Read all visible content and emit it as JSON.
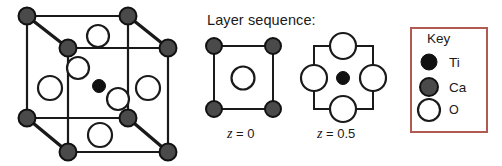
{
  "figure": {
    "title": "",
    "background": "#ffffff",
    "width": 502,
    "height": 166
  },
  "colors": {
    "ti": "#111111",
    "ca": "#4a4a4a",
    "oxygen_fill": "#ffffff",
    "outline": "#1a1a1a",
    "key_border": "#b05a52",
    "text": "#1a1a1a"
  },
  "unit_cell": {
    "name": "perovskite-unit-cell",
    "edges_stroke": "#1a1a1a",
    "vertices": [
      {
        "name": "back-top-left",
        "x": 27,
        "y": 16,
        "species": "Ca"
      },
      {
        "name": "back-top-right",
        "x": 128,
        "y": 16,
        "species": "Ca"
      },
      {
        "name": "front-top-left",
        "x": 68,
        "y": 48,
        "species": "Ca"
      },
      {
        "name": "front-top-right",
        "x": 168,
        "y": 48,
        "species": "Ca"
      },
      {
        "name": "back-bottom-left",
        "x": 27,
        "y": 118,
        "species": "Ca"
      },
      {
        "name": "back-bottom-right",
        "x": 128,
        "y": 118,
        "species": "Ca"
      },
      {
        "name": "front-bottom-left",
        "x": 68,
        "y": 152,
        "species": "Ca"
      },
      {
        "name": "front-bottom-right",
        "x": 168,
        "y": 152,
        "species": "Ca"
      }
    ],
    "oxygen_atoms": [
      {
        "name": "o-top-face",
        "x": 98,
        "y": 36,
        "r": 11
      },
      {
        "name": "o-left-face",
        "x": 50,
        "y": 88,
        "r": 12
      },
      {
        "name": "o-back-face",
        "x": 78,
        "y": 68,
        "r": 11
      },
      {
        "name": "o-front-face",
        "x": 118,
        "y": 99,
        "r": 11
      },
      {
        "name": "o-right-face",
        "x": 148,
        "y": 88,
        "r": 12
      },
      {
        "name": "o-bottom-face",
        "x": 100,
        "y": 135,
        "r": 12
      }
    ],
    "titanium_atoms": [
      {
        "name": "ti-body-center",
        "x": 99,
        "y": 86,
        "r": 6.5
      }
    ]
  },
  "layer_sequence": {
    "title": "Layer sequence:",
    "layers": [
      {
        "name": "layer-z0",
        "label_var": "z",
        "label_eq": " = 0",
        "square": {
          "x": 214,
          "y": 46,
          "w": 59,
          "h": 63
        },
        "corner_species": "Ca",
        "corner_radius": 8,
        "center_atoms": [
          {
            "name": "o-center",
            "species": "O",
            "x": 243,
            "y": 78,
            "r": 11.5
          }
        ]
      },
      {
        "name": "layer-z05",
        "label_var": "z",
        "label_eq": " =  0.5",
        "square": {
          "x": 314,
          "y": 46,
          "w": 59,
          "h": 63
        },
        "edge_atoms": [
          {
            "name": "o-top-edge",
            "species": "O",
            "x": 343,
            "y": 46,
            "r": 13
          },
          {
            "name": "o-left-edge",
            "species": "O",
            "x": 314,
            "y": 78,
            "r": 13
          },
          {
            "name": "o-right-edge",
            "species": "O",
            "x": 373,
            "y": 78,
            "r": 13
          },
          {
            "name": "o-bottom-edge",
            "species": "O",
            "x": 343,
            "y": 109,
            "r": 13
          }
        ],
        "center_atoms": [
          {
            "name": "ti-center",
            "species": "Ti",
            "x": 343,
            "y": 78,
            "r": 6.5
          }
        ]
      }
    ]
  },
  "key": {
    "title": "Key",
    "box": {
      "x": 411,
      "y": 28,
      "w": 76,
      "h": 104
    },
    "border_color": "#b05a52",
    "entries": [
      {
        "name": "key-entry-ti",
        "label": "Ti",
        "marker": "filled-black-circle",
        "fill": "#111111",
        "cx": 429,
        "cy": 62,
        "r": 8
      },
      {
        "name": "key-entry-ca",
        "label": "Ca",
        "marker": "filled-gray-circle",
        "fill": "#4a4a4a",
        "cx": 429,
        "cy": 87,
        "r": 9
      },
      {
        "name": "key-entry-o",
        "label": "O",
        "marker": "open-circle",
        "fill": "#ffffff",
        "cx": 429,
        "cy": 110,
        "r": 11
      }
    ]
  }
}
